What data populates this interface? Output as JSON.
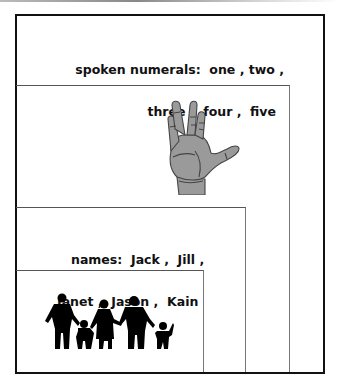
{
  "figure": {
    "layers": [
      {
        "id": "spoken-numerals",
        "label_line1": "spoken numerals:  one , two ,",
        "label_line2": "three ,  four ,  five",
        "category": "spoken numerals",
        "items": [
          "one",
          "two",
          "three",
          "four",
          "five"
        ]
      },
      {
        "id": "hand",
        "icon": "hand-icon",
        "description": "open hand showing five fingers"
      },
      {
        "id": "names",
        "label_line1": "names:  Jack ,  Jill ,",
        "label_line2": "Janet ,  Jason ,  Kain",
        "category": "names",
        "items": [
          "Jack",
          "Jill",
          "Janet",
          "Jason",
          "Kain"
        ]
      },
      {
        "id": "family",
        "icon": "family-silhouette-icon",
        "description": "silhouette of five people holding hands"
      }
    ],
    "colors": {
      "border": "#111111",
      "inner_border": "#666666",
      "hand_fill": "#9a9a9a",
      "silhouette": "#000000",
      "text": "#111111"
    }
  }
}
